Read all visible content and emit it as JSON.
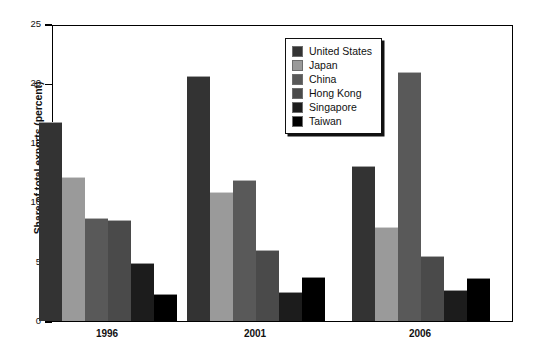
{
  "chart_data": {
    "type": "bar",
    "title": "",
    "xlabel": "",
    "ylabel": "Share of total exports (percent)",
    "categories": [
      "1996",
      "2001",
      "2006"
    ],
    "ylim": [
      0,
      25
    ],
    "yticks": [
      "0",
      "5",
      "10",
      "15",
      "20",
      "25"
    ],
    "ytick_values": [
      0,
      5,
      10,
      15,
      20,
      25
    ],
    "grid": false,
    "legend_position": "top-right",
    "series": [
      {
        "name": "United States",
        "color": "#333333",
        "values": [
          16.7,
          20.5,
          13.0
        ]
      },
      {
        "name": "Japan",
        "color": "#9a9a9a",
        "values": [
          12.0,
          10.8,
          7.8
        ]
      },
      {
        "name": "China",
        "color": "#595959",
        "values": [
          8.6,
          11.8,
          20.9
        ]
      },
      {
        "name": "Hong Kong",
        "color": "#4a4a4a",
        "values": [
          8.4,
          5.9,
          5.4
        ]
      },
      {
        "name": "Singapore",
        "color": "#1c1c1c",
        "values": [
          4.8,
          2.4,
          2.5
        ]
      },
      {
        "name": "Taiwan",
        "color": "#000000",
        "values": [
          2.2,
          3.6,
          3.5
        ]
      }
    ]
  }
}
